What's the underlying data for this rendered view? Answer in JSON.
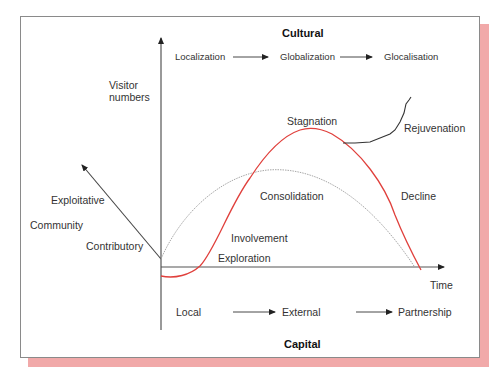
{
  "diagram": {
    "title_top": "Cultural",
    "title_bottom": "Capital",
    "y_axis_label_line1": "Visitor",
    "y_axis_label_line2": "numbers",
    "x_axis_label": "Time",
    "cultural_sequence": [
      "Localization",
      "Globalization",
      "Glocalisation"
    ],
    "capital_sequence": [
      "Local",
      "External",
      "Partnership"
    ],
    "community_axis": {
      "label": "Community",
      "upper": "Exploitative",
      "lower": "Contributory"
    },
    "stages": {
      "exploration": "Exploration",
      "involvement": "Involvement",
      "consolidation": "Consolidation",
      "stagnation": "Stagnation",
      "rejuvenation": "Rejuvenation",
      "decline": "Decline"
    },
    "colors": {
      "tourism_area_life_cycle": "#e0403c",
      "community_curve": "#a8a8a8",
      "rejuvenation_curve": "#333333",
      "shadow": "#f1a9a9"
    }
  }
}
